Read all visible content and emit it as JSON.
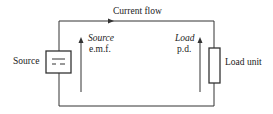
{
  "diagram": {
    "title": "Current flow",
    "source_label": "Source",
    "load_label": "Load unit",
    "source_emf": {
      "line1": "Source",
      "line2": "e.m.f."
    },
    "load_pd": {
      "line1": "Load",
      "line2": "p.d."
    },
    "colors": {
      "line": "#333333",
      "background": "#ffffff"
    }
  }
}
